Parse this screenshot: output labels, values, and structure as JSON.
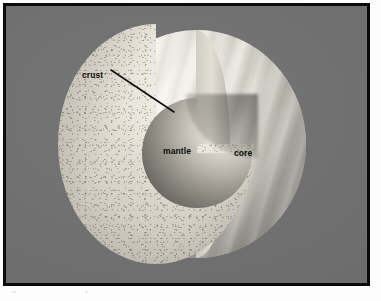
{
  "figure": {
    "kind": "cutaway-cross-section-diagram",
    "background_color": "#6e6e6e",
    "frame_color": "#0b0b0b",
    "page_color": "#fdfdfd",
    "labels": [
      {
        "id": "crust",
        "text": "crust",
        "color": "#0d0d0d",
        "has_leader_line": true,
        "leader_line_color": "#111111"
      },
      {
        "id": "mantle",
        "text": "mantle",
        "color": "#0d0d0d",
        "has_leader_line": false
      },
      {
        "id": "core",
        "text": "core",
        "color": "#0d0d0d",
        "has_leader_line": false
      }
    ],
    "regions": [
      {
        "id": "outer-surface",
        "name": "banded cloud surface",
        "description": "right hemisphere showing swirled latitudinal cloud bands",
        "tone": "#e8e5dd"
      },
      {
        "id": "mantle-face",
        "name": "mantle cut face",
        "description": "speckled rocky interior revealed by the cutaway quadrant",
        "tone": "#ddd9cd"
      },
      {
        "id": "core",
        "name": "core",
        "description": "dark nested sphere at the centre",
        "tone": "#8d8a82"
      }
    ]
  },
  "caption": {
    "text": "Figure     the interior of the planet"
  }
}
